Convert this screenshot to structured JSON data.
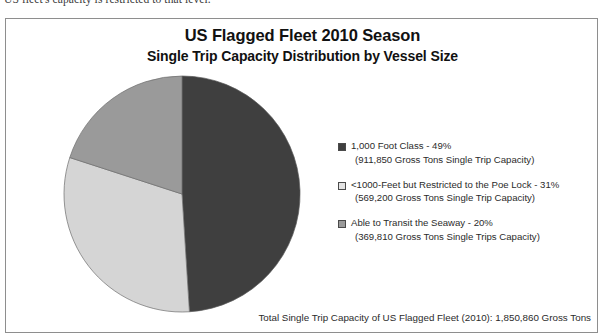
{
  "page": {
    "cut_off_line": "US fleet's capacity is restricted to that level."
  },
  "figure": {
    "title": "US Flagged Fleet 2010 Season",
    "subtitle": "Single Trip Capacity Distribution by Vessel Size",
    "footer": "Total Single Trip Capacity of US Flagged Fleet (2010):  1,850,860 Gross Tons",
    "legend": [
      {
        "label": "1,000 Foot Class - 49%",
        "detail": "(911,850 Gross Tons Single Trip Capacity)",
        "color": "#3f3f3f"
      },
      {
        "label": "<1000-Feet but Restricted to the Poe Lock - 31%",
        "detail": "(569,200 Gross Tons Single Trip Capacity)",
        "color": "#d5d5d5"
      },
      {
        "label": "Able to Transit the Seaway - 20%",
        "detail": "(369,810 Gross Tons Single Trips Capacity)",
        "color": "#9a9a9a"
      }
    ]
  },
  "chart_data": {
    "type": "pie",
    "title": "US Flagged Fleet 2010 Season",
    "subtitle": "Single Trip Capacity Distribution by Vessel Size",
    "categories": [
      "1,000 Foot Class",
      "<1000-Feet but Restricted to the Poe Lock",
      "Able to Transit the Seaway"
    ],
    "values": [
      49,
      31,
      20
    ],
    "value_unit": "percent",
    "absolute_values": [
      911850,
      569200,
      369810
    ],
    "absolute_unit": "Gross Tons Single Trip Capacity",
    "total": 1850860,
    "colors": [
      "#3f3f3f",
      "#d5d5d5",
      "#9a9a9a"
    ],
    "start_angle_deg": 0,
    "direction": "clockwise",
    "legend_position": "right",
    "grid": false,
    "data_labels": false
  }
}
